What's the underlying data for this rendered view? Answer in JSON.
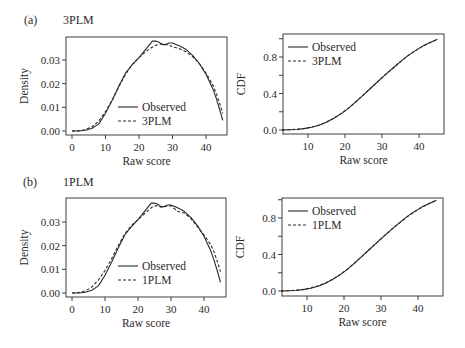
{
  "figure": {
    "rows": [
      {
        "letter": "(a)",
        "model": "3PLM"
      },
      {
        "letter": "(b)",
        "model": "1PLM"
      }
    ]
  },
  "chart_data": [
    {
      "id": "a-density",
      "type": "line",
      "title": "3PLM",
      "panel": "(a)",
      "xlabel": "Raw score",
      "ylabel": "Density",
      "xlim": [
        0,
        45
      ],
      "ylim": [
        0,
        0.038
      ],
      "xticks": [
        0,
        10,
        20,
        30,
        40
      ],
      "yticks": [
        0.0,
        0.01,
        0.02,
        0.03
      ],
      "ytick_labels": [
        "0.00",
        "0.01",
        "0.02",
        "0.03"
      ],
      "grid": false,
      "legend": {
        "position": "bottom-right-inside",
        "entries": [
          "Observed",
          "3PLM"
        ]
      },
      "x": [
        0,
        2,
        4,
        6,
        8,
        10,
        12,
        14,
        16,
        18,
        20,
        22,
        24,
        25,
        26,
        27,
        28,
        29,
        30,
        32,
        34,
        36,
        38,
        40,
        42,
        43,
        44,
        45
      ],
      "series": [
        {
          "name": "Observed",
          "style": "solid",
          "values": [
            0.0,
            0.0,
            0.0003,
            0.0012,
            0.003,
            0.0075,
            0.013,
            0.019,
            0.0245,
            0.028,
            0.031,
            0.0345,
            0.038,
            0.038,
            0.0375,
            0.0365,
            0.0365,
            0.0372,
            0.0372,
            0.036,
            0.0345,
            0.032,
            0.0285,
            0.024,
            0.018,
            0.014,
            0.0095,
            0.0045
          ]
        },
        {
          "name": "3PLM",
          "style": "dashed",
          "values": [
            0.0,
            0.0001,
            0.0006,
            0.0018,
            0.0042,
            0.0082,
            0.013,
            0.0188,
            0.024,
            0.0282,
            0.031,
            0.0335,
            0.0355,
            0.0362,
            0.0366,
            0.0368,
            0.0366,
            0.0362,
            0.0356,
            0.0348,
            0.0335,
            0.0315,
            0.0285,
            0.0245,
            0.0195,
            0.016,
            0.012,
            0.0075
          ]
        }
      ]
    },
    {
      "id": "a-cdf",
      "type": "line",
      "title": "",
      "panel": "(a)",
      "xlabel": "Raw score",
      "ylabel": "CDF",
      "xlim": [
        3,
        46
      ],
      "ylim": [
        0,
        1
      ],
      "xticks": [
        10,
        20,
        30,
        40
      ],
      "yticks": [
        0.0,
        0.2,
        0.4,
        0.6,
        0.8,
        1.0
      ],
      "ytick_labels": [
        "0.0",
        "",
        "0.4",
        "",
        "0.8",
        ""
      ],
      "grid": false,
      "legend": {
        "position": "top-left-inside",
        "entries": [
          "Observed",
          "3PLM"
        ]
      },
      "x": [
        3,
        5,
        7,
        9,
        11,
        13,
        15,
        17,
        19,
        21,
        23,
        25,
        27,
        29,
        31,
        33,
        35,
        37,
        39,
        41,
        43,
        45
      ],
      "series": [
        {
          "name": "Observed",
          "style": "solid",
          "values": [
            0.0,
            0.002,
            0.006,
            0.015,
            0.03,
            0.052,
            0.085,
            0.128,
            0.18,
            0.24,
            0.31,
            0.385,
            0.46,
            0.535,
            0.61,
            0.68,
            0.75,
            0.815,
            0.87,
            0.92,
            0.96,
            0.995
          ]
        },
        {
          "name": "3PLM",
          "style": "dashed",
          "values": [
            0.0,
            0.003,
            0.008,
            0.018,
            0.033,
            0.055,
            0.088,
            0.13,
            0.182,
            0.242,
            0.312,
            0.386,
            0.461,
            0.536,
            0.61,
            0.68,
            0.748,
            0.812,
            0.868,
            0.918,
            0.958,
            0.993
          ]
        }
      ]
    },
    {
      "id": "b-density",
      "type": "line",
      "title": "1PLM",
      "panel": "(b)",
      "xlabel": "Raw score",
      "ylabel": "Density",
      "xlim": [
        0,
        45
      ],
      "ylim": [
        0,
        0.038
      ],
      "xticks": [
        0,
        10,
        20,
        30,
        40
      ],
      "yticks": [
        0.0,
        0.01,
        0.02,
        0.03
      ],
      "ytick_labels": [
        "0.00",
        "0.01",
        "0.02",
        "0.03"
      ],
      "grid": false,
      "legend": {
        "position": "bottom-right-inside",
        "entries": [
          "Observed",
          "1PLM"
        ]
      },
      "x": [
        0,
        2,
        4,
        6,
        8,
        10,
        12,
        14,
        16,
        18,
        20,
        22,
        24,
        25,
        26,
        27,
        28,
        29,
        30,
        32,
        34,
        36,
        38,
        40,
        42,
        43,
        44,
        45
      ],
      "series": [
        {
          "name": "Observed",
          "style": "solid",
          "values": [
            0.0,
            0.0,
            0.0003,
            0.0012,
            0.003,
            0.0075,
            0.013,
            0.019,
            0.0245,
            0.028,
            0.031,
            0.0345,
            0.038,
            0.038,
            0.0375,
            0.0365,
            0.0365,
            0.0372,
            0.0372,
            0.036,
            0.0345,
            0.032,
            0.0285,
            0.024,
            0.018,
            0.014,
            0.0095,
            0.0045
          ]
        },
        {
          "name": "1PLM",
          "style": "dashed",
          "values": [
            0.0,
            0.0002,
            0.0009,
            0.0025,
            0.0055,
            0.0095,
            0.0145,
            0.02,
            0.025,
            0.0285,
            0.031,
            0.0335,
            0.036,
            0.0368,
            0.0368,
            0.0362,
            0.0365,
            0.0368,
            0.0368,
            0.0345,
            0.0338,
            0.0315,
            0.028,
            0.0245,
            0.0205,
            0.0175,
            0.0135,
            0.009
          ]
        }
      ]
    },
    {
      "id": "b-cdf",
      "type": "line",
      "title": "",
      "panel": "(b)",
      "xlabel": "Raw score",
      "ylabel": "CDF",
      "xlim": [
        3,
        46
      ],
      "ylim": [
        0,
        1
      ],
      "xticks": [
        10,
        20,
        30,
        40
      ],
      "yticks": [
        0.0,
        0.2,
        0.4,
        0.6,
        0.8,
        1.0
      ],
      "ytick_labels": [
        "0.0",
        "",
        "0.4",
        "",
        "0.8",
        ""
      ],
      "grid": false,
      "legend": {
        "position": "top-left-inside",
        "entries": [
          "Observed",
          "1PLM"
        ]
      },
      "x": [
        3,
        5,
        7,
        9,
        11,
        13,
        15,
        17,
        19,
        21,
        23,
        25,
        27,
        29,
        31,
        33,
        35,
        37,
        39,
        41,
        43,
        45
      ],
      "series": [
        {
          "name": "Observed",
          "style": "solid",
          "values": [
            0.0,
            0.002,
            0.006,
            0.015,
            0.03,
            0.052,
            0.085,
            0.128,
            0.18,
            0.24,
            0.31,
            0.385,
            0.46,
            0.535,
            0.61,
            0.68,
            0.75,
            0.815,
            0.87,
            0.92,
            0.96,
            0.995
          ]
        },
        {
          "name": "1PLM",
          "style": "dashed",
          "values": [
            0.0,
            0.003,
            0.009,
            0.019,
            0.034,
            0.056,
            0.088,
            0.13,
            0.182,
            0.242,
            0.312,
            0.386,
            0.46,
            0.534,
            0.608,
            0.678,
            0.746,
            0.81,
            0.866,
            0.916,
            0.958,
            0.994
          ]
        }
      ]
    }
  ],
  "layout": {
    "panels": [
      {
        "frame": [
          66,
          37,
          227,
          135
        ],
        "xmap": [
          0,
          72,
          40,
          206
        ],
        "ymap": [
          0,
          131,
          0.03,
          60
        ]
      },
      {
        "frame": [
          283,
          34,
          444,
          134
        ],
        "xmap": [
          10,
          308,
          40,
          419
        ],
        "ymap": [
          0,
          130,
          0.8,
          57
        ]
      },
      {
        "frame": [
          66,
          198,
          226,
          297
        ],
        "xmap": [
          0,
          72,
          40,
          204
        ],
        "ymap": [
          0,
          293,
          0.03,
          222
        ]
      },
      {
        "frame": [
          282,
          198,
          443,
          296
        ],
        "xmap": [
          10,
          307,
          40,
          418
        ],
        "ymap": [
          0,
          291,
          0.8,
          218
        ]
      }
    ],
    "legend_anchor": [
      [
        118,
        107
      ],
      [
        288,
        47
      ],
      [
        118,
        266
      ],
      [
        288,
        211
      ]
    ],
    "line_color": "#2a2a2a"
  }
}
